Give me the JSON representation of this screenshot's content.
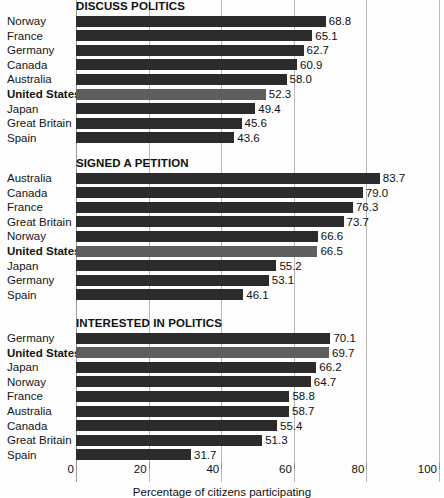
{
  "chart_data": {
    "type": "bar",
    "orientation": "horizontal",
    "title": "",
    "xlabel": "Percentage of citizens participating",
    "ylabel": "",
    "xlim": [
      0,
      100
    ],
    "xticks": [
      0,
      20,
      40,
      60,
      80,
      100
    ],
    "xtick_labels": [
      "0",
      "20",
      "40",
      "60",
      "80",
      "100"
    ],
    "grid": "vertical",
    "legend": "none",
    "highlight_category": "United States",
    "colors": {
      "bar": "#2b2b2b",
      "bar_highlight": "#5e5e5e",
      "gridline": "#b9b9b9",
      "text": "#101010",
      "background": "#ffffff"
    },
    "panels": [
      {
        "title": "DISCUSS POLITICS",
        "categories": [
          "Norway",
          "France",
          "Germany",
          "Canada",
          "Australia",
          "United States",
          "Japan",
          "Great Britain",
          "Spain"
        ],
        "values": [
          68.8,
          65.1,
          62.7,
          60.9,
          58.0,
          52.3,
          49.4,
          45.6,
          43.6
        ],
        "value_labels": [
          "68.8",
          "65.1",
          "62.7",
          "60.9",
          "58.0",
          "52.3",
          "49.4",
          "45.6",
          "43.6"
        ]
      },
      {
        "title": "SIGNED A PETITION",
        "categories": [
          "Australia",
          "Canada",
          "France",
          "Great Britain",
          "Norway",
          "United States",
          "Japan",
          "Germany",
          "Spain"
        ],
        "values": [
          83.7,
          79.0,
          76.3,
          73.7,
          66.6,
          66.5,
          55.2,
          53.1,
          46.1
        ],
        "value_labels": [
          "83.7",
          "79.0",
          "76.3",
          "73.7",
          "66.6",
          "66.5",
          "55.2",
          "53.1",
          "46.1"
        ]
      },
      {
        "title": "INTERESTED IN POLITICS",
        "categories": [
          "Germany",
          "United States",
          "Japan",
          "Norway",
          "France",
          "Australia",
          "Canada",
          "Great Britain",
          "Spain"
        ],
        "values": [
          70.1,
          69.7,
          66.2,
          64.7,
          58.8,
          58.7,
          55.4,
          51.3,
          31.7
        ],
        "value_labels": [
          "70.1",
          "69.7",
          "66.2",
          "64.7",
          "58.8",
          "58.7",
          "55.4",
          "51.3",
          "31.7"
        ]
      }
    ]
  }
}
